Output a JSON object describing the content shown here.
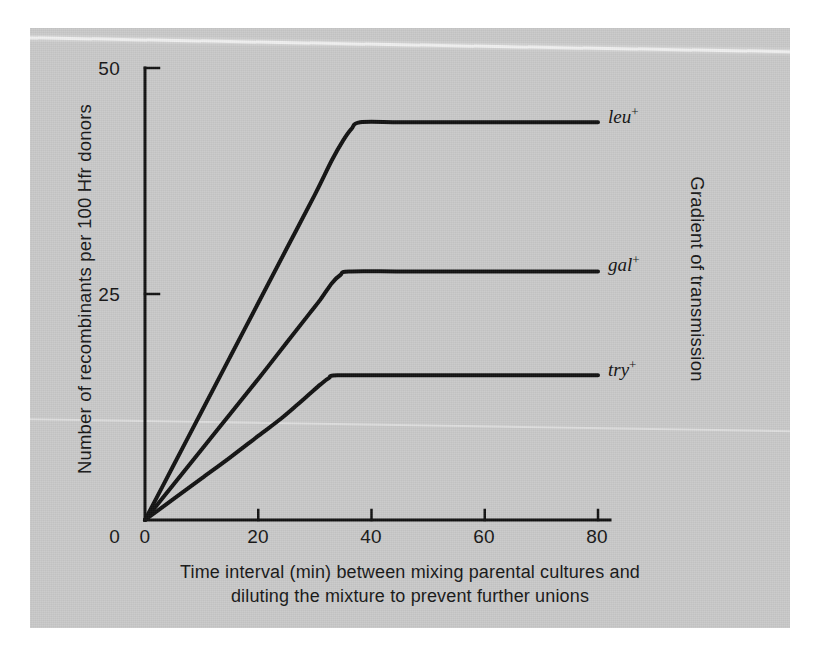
{
  "figure": {
    "background_color": "#c9c9c9",
    "page_color": "#ffffff",
    "line_color": "#111111"
  },
  "axes": {
    "y_title": "Number of recombinants per 100 Hfr donors",
    "y_ticks": [
      "0",
      "25",
      "50"
    ],
    "x_ticks": [
      "0",
      "20",
      "40",
      "60",
      "80"
    ],
    "secondary_y_title": "Gradient of transmission",
    "caption_line_1": "Time interval (min) between mixing parental cultures and",
    "caption_line_2": "diluting the mixture to prevent further unions"
  },
  "series_labels": {
    "leu": {
      "name": "leu",
      "charge": "+"
    },
    "gal": {
      "name": "gal",
      "charge": "+"
    },
    "try": {
      "name": "try",
      "charge": "+"
    }
  },
  "chart_data": {
    "type": "line",
    "title": "",
    "xlabel": "Time interval (min) between mixing parental cultures and diluting the mixture to prevent further unions",
    "ylabel": "Number of recombinants per 100 Hfr donors",
    "secondary_ylabel": "Gradient of transmission",
    "xlim": [
      0,
      84
    ],
    "ylim": [
      0,
      50
    ],
    "xticks": [
      0,
      20,
      40,
      60,
      80
    ],
    "yticks": [
      0,
      25,
      50
    ],
    "grid": false,
    "legend": "inline-right-of-curve",
    "series": [
      {
        "name": "leu+",
        "plateau_value": 44,
        "saturation_time_min": 37,
        "x": [
          0,
          5,
          10,
          15,
          20,
          25,
          30,
          33,
          35,
          36.5,
          38,
          45,
          55,
          65,
          75,
          80
        ],
        "y": [
          0,
          6.0,
          12.0,
          18.0,
          24.0,
          30.0,
          36.0,
          39.8,
          42.0,
          43.3,
          44.0,
          44.0,
          44.0,
          44.0,
          44.0,
          44.0
        ]
      },
      {
        "name": "gal+",
        "plateau_value": 27.5,
        "saturation_time_min": 35,
        "x": [
          0,
          5,
          10,
          15,
          20,
          25,
          29,
          31,
          33,
          34.5,
          36,
          45,
          55,
          65,
          75,
          80
        ],
        "y": [
          0,
          3.9,
          7.8,
          11.7,
          15.6,
          19.6,
          22.8,
          24.4,
          26.2,
          27.1,
          27.5,
          27.5,
          27.5,
          27.5,
          27.5,
          27.5
        ]
      },
      {
        "name": "try+",
        "plateau_value": 16,
        "saturation_time_min": 33,
        "x": [
          0,
          5,
          10,
          15,
          20,
          24,
          27,
          29,
          31,
          32.5,
          34,
          45,
          55,
          65,
          75,
          80
        ],
        "y": [
          0,
          2.3,
          4.6,
          6.9,
          9.3,
          11.2,
          12.8,
          13.9,
          15.0,
          15.7,
          16.0,
          16.0,
          16.0,
          16.0,
          16.0,
          16.0
        ]
      }
    ]
  },
  "geometry": {
    "origin_x_px": 115,
    "origin_y_px": 492,
    "x_axis_end_px": 580,
    "y_axis_top_px": 40,
    "x_per_min_px": 5.6625,
    "y_per_unit_px": 9.04
  }
}
